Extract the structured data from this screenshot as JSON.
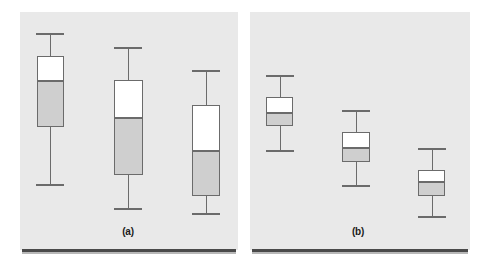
{
  "figure": {
    "background_color": "#ffffff",
    "panel_background_color": "#e9e9e9",
    "box_fill_upper": "#ffffff",
    "box_fill_lower": "#cfcfcf",
    "line_color": "#6b6b6b",
    "rule_color": "#4a4a4a"
  },
  "panels": [
    {
      "label": "(a)",
      "name": "panel-a",
      "x": 20,
      "y": 12,
      "width": 218,
      "height": 238,
      "label_x": 103,
      "label_y": 226,
      "label_width": 50,
      "rule": {
        "x": 22,
        "y": 249,
        "width": 214,
        "height": 3
      },
      "rule_shadow": {
        "x": 22,
        "y": 252,
        "width": 214,
        "height": 2
      }
    },
    {
      "label": "(b)",
      "name": "panel-b",
      "x": 250,
      "y": 12,
      "width": 220,
      "height": 238,
      "label_x": 333,
      "label_y": 226,
      "label_width": 50,
      "rule": {
        "x": 252,
        "y": 249,
        "width": 216,
        "height": 3
      },
      "rule_shadow": {
        "x": 252,
        "y": 252,
        "width": 216,
        "height": 2
      }
    }
  ],
  "chart_data": {
    "type": "box",
    "title": "",
    "subtitle": "",
    "xlabel": "",
    "ylabel": "",
    "grid": false,
    "legend": false,
    "axis_ticks": false,
    "tick_labels": [],
    "note": "Two side-by-side panels of three unlabeled box-and-whisker plots each. Values are read off pixel positions; y increases downward in pixel space, so larger pixel y means smaller data value. No numeric axis is printed on the figure.",
    "panels": [
      {
        "label": "(a)",
        "description": "Three boxes with wide interquartile ranges and long whiskers, stepping downward left to right.",
        "boxes": [
          {
            "name": "box-a1",
            "center_x": 50,
            "box_left": 37,
            "box_right": 64,
            "whisker_high_y": 33,
            "q3_y": 56,
            "median_y": 80,
            "q1_y": 127,
            "whisker_low_y": 184,
            "cap_half_width": 14
          },
          {
            "name": "box-a2",
            "center_x": 128,
            "box_left": 114,
            "box_right": 143,
            "whisker_high_y": 47,
            "q3_y": 80,
            "median_y": 117,
            "q1_y": 175,
            "whisker_low_y": 208,
            "cap_half_width": 14
          },
          {
            "name": "box-a3",
            "center_x": 206,
            "box_left": 192,
            "box_right": 220,
            "whisker_high_y": 70,
            "q3_y": 105,
            "median_y": 150,
            "q1_y": 196,
            "whisker_low_y": 213,
            "cap_half_width": 14
          }
        ]
      },
      {
        "label": "(b)",
        "description": "Three boxes with narrow interquartile ranges and short whiskers, stepping downward left to right.",
        "boxes": [
          {
            "name": "box-b1",
            "center_x": 280,
            "box_left": 266,
            "box_right": 293,
            "whisker_high_y": 75,
            "q3_y": 97,
            "median_y": 112,
            "q1_y": 126,
            "whisker_low_y": 150,
            "cap_half_width": 14
          },
          {
            "name": "box-b2",
            "center_x": 356,
            "box_left": 342,
            "box_right": 370,
            "whisker_high_y": 110,
            "q3_y": 132,
            "median_y": 147,
            "q1_y": 162,
            "whisker_low_y": 185,
            "cap_half_width": 14
          },
          {
            "name": "box-b3",
            "center_x": 432,
            "box_left": 418,
            "box_right": 445,
            "whisker_high_y": 148,
            "q3_y": 170,
            "median_y": 181,
            "q1_y": 196,
            "whisker_low_y": 216,
            "cap_half_width": 14
          }
        ]
      }
    ]
  }
}
